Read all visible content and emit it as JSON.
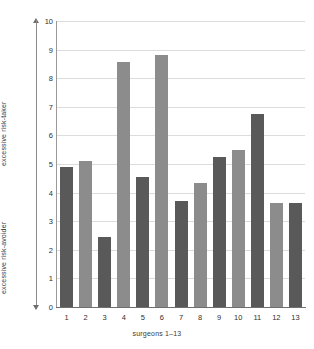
{
  "chart_data": {
    "type": "bar",
    "title": "",
    "xlabel": "surgeons 1–13",
    "ylabel_top": "excessive risk-taker",
    "ylabel_bottom": "excessive risk-avoider",
    "categories": [
      "1",
      "2",
      "3",
      "4",
      "5",
      "6",
      "7",
      "8",
      "9",
      "10",
      "11",
      "12",
      "13"
    ],
    "values": [
      4.9,
      5.1,
      2.45,
      8.55,
      4.55,
      8.8,
      3.7,
      4.35,
      5.25,
      5.5,
      6.75,
      3.65,
      3.65
    ],
    "ylim": [
      0,
      10
    ],
    "yticks": [
      "0",
      "1",
      "2",
      "3",
      "4",
      "5",
      "6",
      "7",
      "8",
      "9",
      "10"
    ],
    "grid": true,
    "legend": "none",
    "bar_colors": [
      "#59595a",
      "#8c8c8d"
    ],
    "grid_color": "#dcdcdc",
    "axis_color": "#8a8a8a",
    "background": "#ffffff"
  }
}
